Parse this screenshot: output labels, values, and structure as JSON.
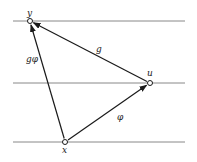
{
  "diagram": {
    "title": "",
    "levels": [
      {
        "y": 21
      },
      {
        "y": 83
      },
      {
        "y": 142
      }
    ],
    "nodes": [
      {
        "id": "y",
        "label": "y",
        "x": 30,
        "y": 21
      },
      {
        "id": "u",
        "label": "u",
        "x": 150,
        "y": 83
      },
      {
        "id": "x",
        "label": "x",
        "x": 65,
        "y": 142
      }
    ],
    "edges": [
      {
        "from": "u",
        "to": "y",
        "label": "g"
      },
      {
        "from": "x",
        "to": "u",
        "label": "φ"
      },
      {
        "from": "x",
        "to": "y",
        "label": "gφ"
      }
    ],
    "colors": {
      "line": "#888888",
      "edge": "#1a1a1a"
    }
  }
}
